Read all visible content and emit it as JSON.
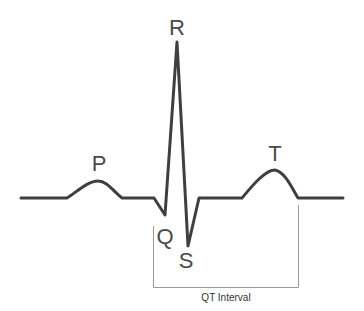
{
  "diagram": {
    "labels": {
      "P": "P",
      "Q": "Q",
      "R": "R",
      "S": "S",
      "T": "T"
    },
    "interval_label": "QT Interval",
    "colors": {
      "trace": "#3f3f3f",
      "bracket": "#9a9a9a",
      "text": "#4a4a4a"
    }
  }
}
